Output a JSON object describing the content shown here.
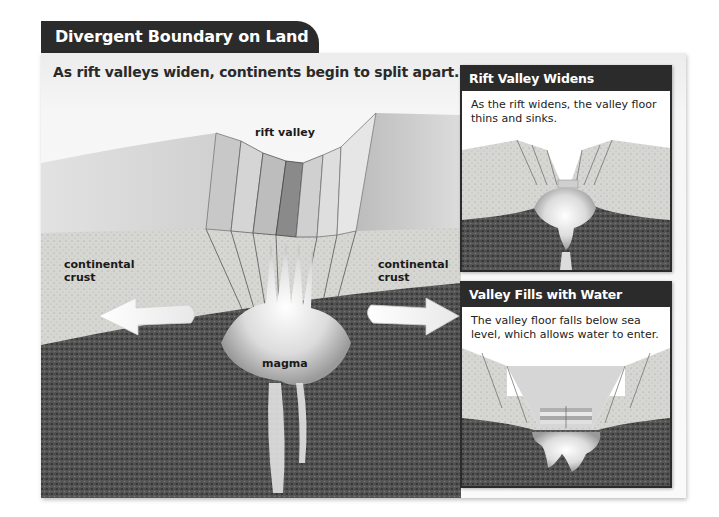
{
  "figure": {
    "title": "Divergent Boundary on Land",
    "subtitle": "As rift valleys widen, continents begin to split apart."
  },
  "main_diagram": {
    "labels": {
      "rift_valley": "rift valley",
      "left_crust_line1": "continental",
      "left_crust_line2": "crust",
      "right_crust_line1": "continental",
      "right_crust_line2": "crust",
      "magma": "magma"
    },
    "arrows": [
      "arrow-left (plates moving apart)",
      "arrow-right (plates moving apart)"
    ]
  },
  "insets": [
    {
      "title": "Rift Valley Widens",
      "text": "As the rift widens, the valley floor thins and sinks."
    },
    {
      "title": "Valley Fills with Water",
      "text": "The valley floor falls below sea level, which allows water to enter."
    }
  ],
  "colors": {
    "header_bg": "#2b2b2b",
    "crust": "#d8d8d4",
    "mantle": "#4a4a4a",
    "magma": "#e8e8e8",
    "water": "#c9c9c9"
  }
}
